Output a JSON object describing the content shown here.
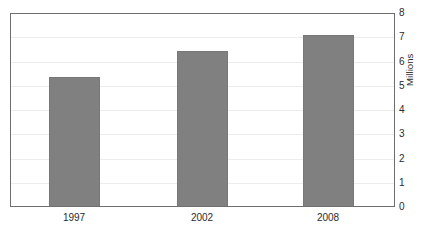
{
  "chart_data": {
    "type": "bar",
    "title": "",
    "subtitle": "",
    "xlabel": "",
    "ylabel": "Millions",
    "categories": [
      "1997",
      "2002",
      "2008"
    ],
    "values": [
      5.3,
      6.4,
      7.05
    ],
    "series": [
      {
        "name": "Millions",
        "values": [
          5.3,
          6.4,
          7.05
        ]
      }
    ],
    "ylim": [
      0,
      8
    ],
    "ytick_labels": [
      "0",
      "1",
      "2",
      "3",
      "4",
      "5",
      "6",
      "7",
      "8"
    ],
    "ytick_values": [
      0,
      1,
      2,
      3,
      4,
      5,
      6,
      7,
      8
    ],
    "grid": true,
    "grid_axis": "y",
    "legend": false,
    "legend_position": "none",
    "bar_color": "#808080",
    "grid_color": "#ededed",
    "frame_color": "#6e6e6e",
    "text_color": "#2b2b2b",
    "background_color": "#ffffff",
    "annotations": []
  }
}
